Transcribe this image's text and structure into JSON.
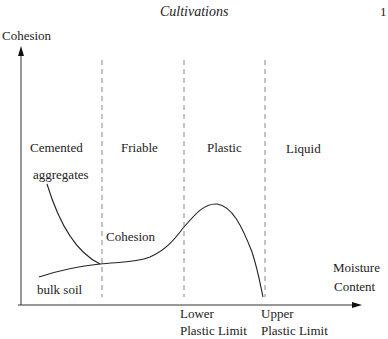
{
  "header": {
    "title": "Cultivations",
    "page_number": "1"
  },
  "diagram": {
    "y_axis_label": "Cohesion",
    "x_axis_label": [
      "Moisture",
      "Content"
    ],
    "zones": [
      "Cemented",
      "Friable",
      "Plastic",
      "Liquid"
    ],
    "zone_sublabel": "aggregates",
    "curve_labels": {
      "cohesion": "Cohesion",
      "bulk_soil": "bulk soil"
    },
    "limits": {
      "lower": [
        "Lower",
        "Plastic Limit"
      ],
      "upper": [
        "Upper",
        "Plastic Limit"
      ]
    },
    "colors": {
      "line": "#222222",
      "dash": "#888888"
    }
  }
}
